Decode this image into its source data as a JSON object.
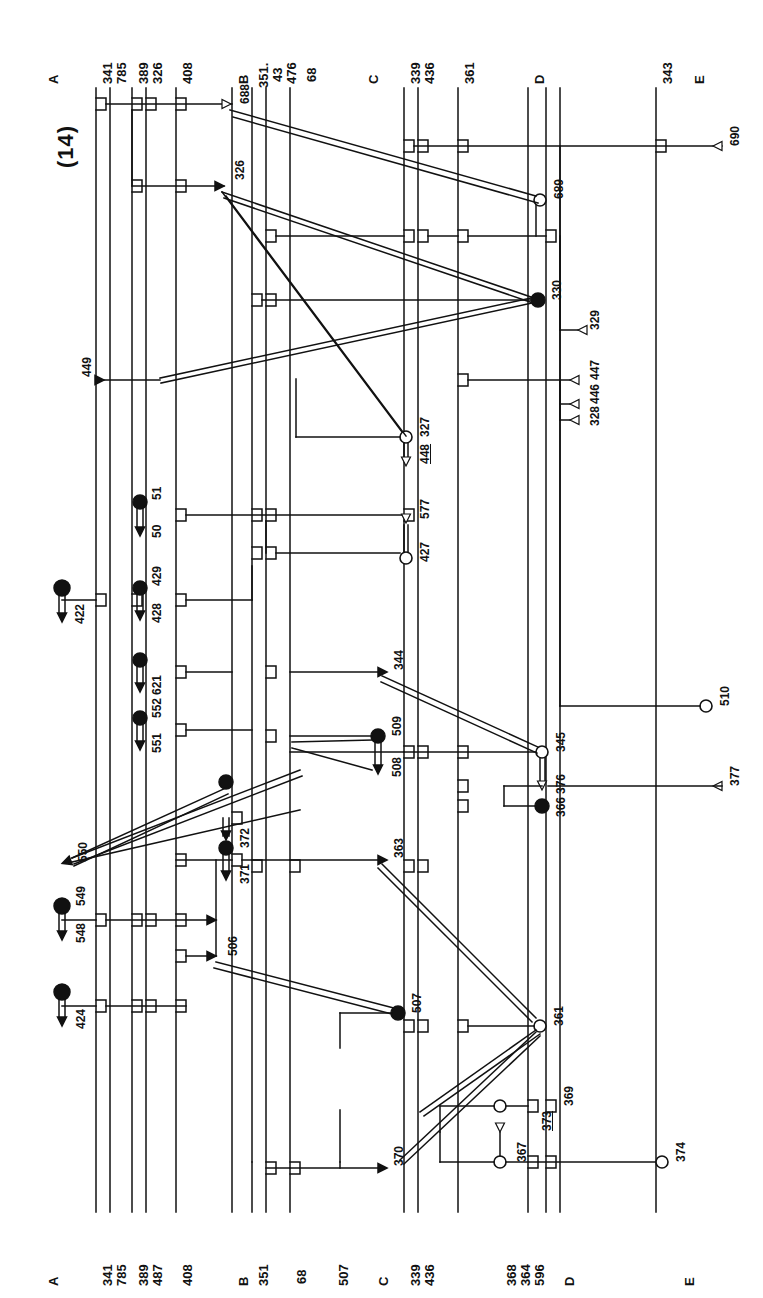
{
  "page": {
    "figure_number": "(14)",
    "running_head_left": "",
    "running_head_right": "",
    "width": 763,
    "height": 1298,
    "ink_color": "#111111",
    "paper_color": "#ffffff"
  },
  "diagram": {
    "type": "patent-schematic-ladder",
    "orientation": "rotated-90-ccw",
    "bus_labels_top": [
      "A",
      "341",
      "785",
      "389",
      "326",
      "408",
      "B",
      "351.",
      "43",
      "476",
      "68",
      "C",
      "339",
      "436",
      "361",
      "D",
      "343",
      "E"
    ],
    "bus_labels_bottom": [
      "A",
      "341",
      "785",
      "389",
      "487",
      "408",
      "B",
      "351",
      "68",
      "507",
      "C",
      "339",
      "436",
      "368",
      "364",
      "596",
      "D",
      "E"
    ],
    "section_letters": [
      "A",
      "B",
      "C",
      "D",
      "E"
    ],
    "terminals": [
      {
        "id": "688",
        "marker": "open-triangle"
      },
      {
        "id": "690",
        "marker": "open-triangle"
      },
      {
        "id": "689",
        "marker": "open-circle"
      },
      {
        "id": "326",
        "marker": "filled-triangle"
      },
      {
        "id": "330",
        "marker": "filled-circle"
      },
      {
        "id": "449",
        "marker": "filled-triangle"
      },
      {
        "id": "327",
        "marker": "open-circle"
      },
      {
        "id": "448",
        "marker": "open-triangle",
        "underlined": true
      },
      {
        "id": "329",
        "marker": "open-triangle"
      },
      {
        "id": "447",
        "marker": "open-triangle"
      },
      {
        "id": "446",
        "marker": "open-triangle"
      },
      {
        "id": "328",
        "marker": "open-triangle"
      },
      {
        "id": "51",
        "marker": "filled-circle"
      },
      {
        "id": "50",
        "marker": "filled-triangle"
      },
      {
        "id": "577",
        "marker": "open-triangle"
      },
      {
        "id": "427",
        "marker": "open-circle"
      },
      {
        "id": "429",
        "marker": "filled-circle"
      },
      {
        "id": "428",
        "marker": "filled-triangle"
      },
      {
        "id": "422",
        "marker": "filled-circle-arrow"
      },
      {
        "id": "621",
        "marker": "filled-circle-arrow"
      },
      {
        "id": "552",
        "marker": "filled-circle"
      },
      {
        "id": "551",
        "marker": "filled-triangle"
      },
      {
        "id": "344",
        "marker": "filled-triangle"
      },
      {
        "id": "509",
        "marker": "filled-circle"
      },
      {
        "id": "508",
        "marker": "filled-triangle"
      },
      {
        "id": "345",
        "marker": "open-circle"
      },
      {
        "id": "376",
        "marker": "open-triangle"
      },
      {
        "id": "366",
        "marker": "filled-circle"
      },
      {
        "id": "510",
        "marker": "open-circle"
      },
      {
        "id": "377",
        "marker": "open-triangle"
      },
      {
        "id": "550",
        "marker": "filled-triangle"
      },
      {
        "id": "372",
        "marker": "filled-circle"
      },
      {
        "id": "371",
        "marker": "filled-triangle"
      },
      {
        "id": "549",
        "marker": "filled-circle"
      },
      {
        "id": "548",
        "marker": "filled-triangle"
      },
      {
        "id": "506",
        "marker": "filled-triangle"
      },
      {
        "id": "424",
        "marker": "filled-circle-arrow"
      },
      {
        "id": "507",
        "marker": "filled-circle"
      },
      {
        "id": "363",
        "marker": "filled-triangle"
      },
      {
        "id": "361",
        "marker": "open-circle"
      },
      {
        "id": "369",
        "marker": "open-circle"
      },
      {
        "id": "373",
        "marker": "open-triangle",
        "underlined": true
      },
      {
        "id": "367",
        "marker": "open-circle"
      },
      {
        "id": "370",
        "marker": "filled-triangle"
      },
      {
        "id": "374",
        "marker": "open-circle"
      }
    ],
    "labels": {
      "A": "A",
      "B": "B",
      "C": "C",
      "D": "D",
      "E": "E",
      "n341": "341",
      "n785": "785",
      "n389": "389",
      "n326": "326",
      "n408": "408",
      "n487": "487",
      "n351dot": "351.",
      "n351": "351",
      "n43": "43",
      "n476": "476",
      "n68": "68",
      "n339": "339",
      "n436": "436",
      "n361": "361",
      "n343": "343",
      "n688": "688",
      "n690": "690",
      "n689": "689",
      "n330": "330",
      "n449": "449",
      "n327": "327",
      "n448": "448",
      "n329": "329",
      "n447": "447",
      "n446": "446",
      "n328": "328",
      "n51": "51",
      "n50": "50",
      "n577": "577",
      "n427": "427",
      "n429": "429",
      "n428": "428",
      "n422": "422",
      "n621": "621",
      "n552": "552",
      "n551": "551",
      "n344": "344",
      "n509": "509",
      "n508": "508",
      "n345": "345",
      "n376": "376",
      "n366": "366",
      "n510": "510",
      "n377": "377",
      "n550": "550",
      "n372": "372",
      "n371": "371",
      "n549": "549",
      "n548": "548",
      "n506": "506",
      "n424": "424",
      "n507": "507",
      "n363": "363",
      "n369": "369",
      "n373": "373",
      "n367": "367",
      "n370": "370",
      "n374": "374",
      "n368": "368",
      "n364": "364",
      "n596": "596"
    }
  }
}
